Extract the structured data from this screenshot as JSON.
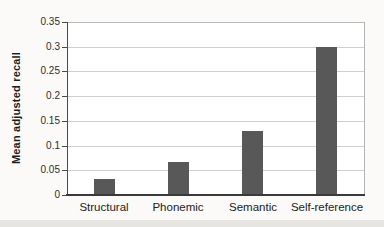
{
  "chart_data": {
    "type": "bar",
    "title": "",
    "xlabel": "",
    "ylabel": "Mean adjusted recall",
    "categories": [
      "Structural",
      "Phonemic",
      "Semantic",
      "Self-reference"
    ],
    "values": [
      0.033,
      0.067,
      0.13,
      0.3
    ],
    "ylim": [
      0,
      0.35
    ],
    "ytick_values": [
      0,
      0.05,
      0.1,
      0.15,
      0.2,
      0.25,
      0.3,
      0.35
    ],
    "ytick_labels": [
      "0",
      "0.05",
      "0.1",
      "0.15",
      "0.2",
      "0.25",
      "0.3",
      "0.35"
    ],
    "grid": "horizontal",
    "legend": "none",
    "colors": {
      "bar": "#585858",
      "gridline": "#cfcfcf",
      "axis": "#3a3a3a",
      "plot_border": "#b9b9b9",
      "text": "#222222",
      "plot_background": "#ffffff",
      "page_background": "#fbfaf8"
    }
  }
}
